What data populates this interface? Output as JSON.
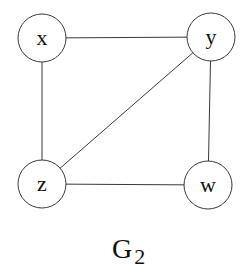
{
  "graph": {
    "title": "G",
    "title_subscript": "2",
    "nodes": [
      {
        "id": "x",
        "label": "x",
        "cx": 42,
        "cy": 38,
        "r": 24
      },
      {
        "id": "y",
        "label": "y",
        "cx": 211,
        "cy": 37,
        "r": 24
      },
      {
        "id": "z",
        "label": "z",
        "cx": 42,
        "cy": 184,
        "r": 24
      },
      {
        "id": "w",
        "label": "w",
        "cx": 208,
        "cy": 185,
        "r": 24
      }
    ],
    "edges": [
      {
        "from": "x",
        "to": "y"
      },
      {
        "from": "x",
        "to": "z"
      },
      {
        "from": "y",
        "to": "z"
      },
      {
        "from": "y",
        "to": "w"
      },
      {
        "from": "z",
        "to": "w"
      }
    ],
    "colors": {
      "stroke": "#3a3a3a",
      "text": "#111111",
      "background": "#ffffff"
    }
  }
}
